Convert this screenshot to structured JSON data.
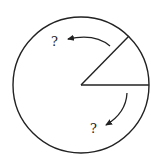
{
  "diagram": {
    "type": "circle-sector",
    "labels": {
      "upper": "?",
      "lower": "?"
    },
    "colors": {
      "stroke": "#222222",
      "background": "#ffffff"
    }
  }
}
